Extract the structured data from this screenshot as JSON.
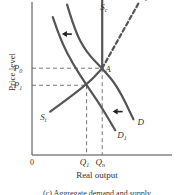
{
  "chart_data": {
    "type": "line",
    "title": "",
    "caption": "(c) Aggregate demand and supply",
    "xlabel": "Real output",
    "ylabel": "Price level",
    "origin_label": "0",
    "x_ticks": [
      {
        "label": "Q",
        "sub": "1",
        "value": 0.42
      },
      {
        "label": "Q",
        "sub": "n",
        "value": 0.54
      }
    ],
    "y_ticks": [
      {
        "label": "P",
        "sub": "0",
        "value": 0.56
      },
      {
        "label": "P",
        "sub": "1",
        "value": 0.45
      }
    ],
    "xlim": [
      0,
      1
    ],
    "ylim": [
      0,
      1
    ],
    "series": [
      {
        "name": "D",
        "style": "solid",
        "points": [
          [
            0.27,
            0.97
          ],
          [
            0.33,
            0.8
          ],
          [
            0.42,
            0.66
          ],
          [
            0.54,
            0.56
          ],
          [
            0.66,
            0.44
          ],
          [
            0.78,
            0.23
          ]
        ]
      },
      {
        "name": "D1",
        "label": "D",
        "label_sub": "1",
        "style": "solid",
        "points": [
          [
            0.16,
            0.89
          ],
          [
            0.22,
            0.74
          ],
          [
            0.32,
            0.58
          ],
          [
            0.42,
            0.45
          ],
          [
            0.52,
            0.33
          ],
          [
            0.64,
            0.16
          ]
        ]
      },
      {
        "name": "Sc",
        "label": "S",
        "label_sub": "c",
        "style": "solid",
        "points": [
          [
            0.54,
            1.0
          ],
          [
            0.54,
            0.56
          ]
        ]
      },
      {
        "name": "Se",
        "label": "S",
        "label_sub": "e",
        "style": "dashed",
        "points": [
          [
            0.54,
            0.56
          ],
          [
            0.82,
            0.98
          ]
        ]
      },
      {
        "name": "St",
        "label": "S",
        "label_sub": "t",
        "style": "solid",
        "points": [
          [
            0.14,
            0.28
          ],
          [
            0.42,
            0.45
          ],
          [
            0.54,
            0.56
          ]
        ]
      }
    ],
    "annotations": [
      {
        "type": "point-label",
        "text": "A",
        "x": 0.54,
        "y": 0.56
      },
      {
        "type": "arrow",
        "direction": "left",
        "x": 0.23,
        "y": 0.78
      },
      {
        "type": "arrow",
        "direction": "left",
        "x": 0.62,
        "y": 0.28
      }
    ],
    "guides": [
      {
        "type": "dashed-h",
        "y": 0.56,
        "to_x": 0.54
      },
      {
        "type": "dashed-h",
        "y": 0.45,
        "to_x": 0.42
      },
      {
        "type": "dashed-v",
        "x": 0.42,
        "to_y": 0.45
      },
      {
        "type": "dashed-v",
        "x": 0.54,
        "to_y": 0.56
      }
    ],
    "grid": false,
    "legend": "none"
  }
}
